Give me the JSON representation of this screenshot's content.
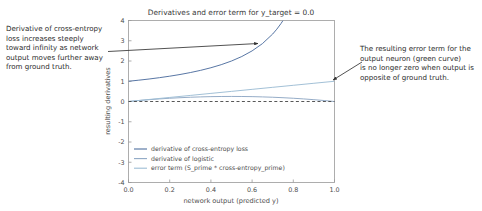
{
  "chart_data": {
    "type": "line",
    "title": "Derivatives and error term for y_target = 0.0",
    "xlabel": "network output (predicted y)",
    "ylabel": "resulting derivatives",
    "xlim": [
      0.0,
      1.0
    ],
    "ylim": [
      -4,
      4
    ],
    "xticks": [
      "0.0",
      "0.2",
      "0.4",
      "0.6",
      "0.8",
      "1.0"
    ],
    "xtick_values": [
      0.0,
      0.2,
      0.4,
      0.6,
      0.8,
      1.0
    ],
    "yticks": [
      "-4",
      "-3",
      "-2",
      "-1",
      "0",
      "1",
      "2",
      "3",
      "4"
    ],
    "ytick_values": [
      -4,
      -3,
      -2,
      -1,
      0,
      1,
      2,
      3,
      4
    ],
    "grid": false,
    "legend_position": "lower left",
    "zero_line": {
      "value": 0,
      "style": "dashed",
      "color": "#444444"
    },
    "series": [
      {
        "name": "derivative of cross-entropy loss",
        "color": "#4f6f9f",
        "formula": "1/(1-y)",
        "x": [
          0.0,
          0.05,
          0.1,
          0.15,
          0.2,
          0.25,
          0.3,
          0.35,
          0.4,
          0.45,
          0.5,
          0.55,
          0.6,
          0.65,
          0.7,
          0.72,
          0.74,
          0.75
        ],
        "values": [
          1.0,
          1.053,
          1.111,
          1.176,
          1.25,
          1.333,
          1.429,
          1.538,
          1.667,
          1.818,
          2.0,
          2.222,
          2.5,
          2.857,
          3.333,
          3.571,
          3.846,
          4.0
        ]
      },
      {
        "name": "derivative of logistic",
        "color": "#8fa8c4",
        "formula": "y*(1-y)",
        "x": [
          0.0,
          0.05,
          0.1,
          0.15,
          0.2,
          0.25,
          0.3,
          0.35,
          0.4,
          0.45,
          0.5,
          0.55,
          0.6,
          0.65,
          0.7,
          0.75,
          0.8,
          0.85,
          0.9,
          0.95,
          1.0
        ],
        "values": [
          0.0,
          0.0475,
          0.09,
          0.1275,
          0.16,
          0.1875,
          0.21,
          0.2275,
          0.24,
          0.2475,
          0.25,
          0.2475,
          0.24,
          0.2275,
          0.21,
          0.1875,
          0.16,
          0.1275,
          0.09,
          0.0475,
          0.0
        ]
      },
      {
        "name": "error term (S_prime * cross-entropy_prime)",
        "color": "#9dbdd4",
        "formula": "y",
        "x": [
          0.0,
          0.1,
          0.2,
          0.3,
          0.4,
          0.5,
          0.6,
          0.7,
          0.8,
          0.9,
          1.0
        ],
        "values": [
          0.0,
          0.1,
          0.2,
          0.3,
          0.4,
          0.5,
          0.6,
          0.7,
          0.8,
          0.9,
          1.0
        ]
      }
    ]
  },
  "annotations": {
    "left": {
      "text": "Derivative of cross-entropy\nloss increases steeply\ntoward infinity as network\noutput moves further away\nfrom ground truth.",
      "arrow_color": "#333333"
    },
    "right": {
      "text": "The resulting error term for the\noutput neuron (green curve)\nis no longer zero when output is\nopposite of ground truth.",
      "arrow_color": "#333333"
    }
  }
}
